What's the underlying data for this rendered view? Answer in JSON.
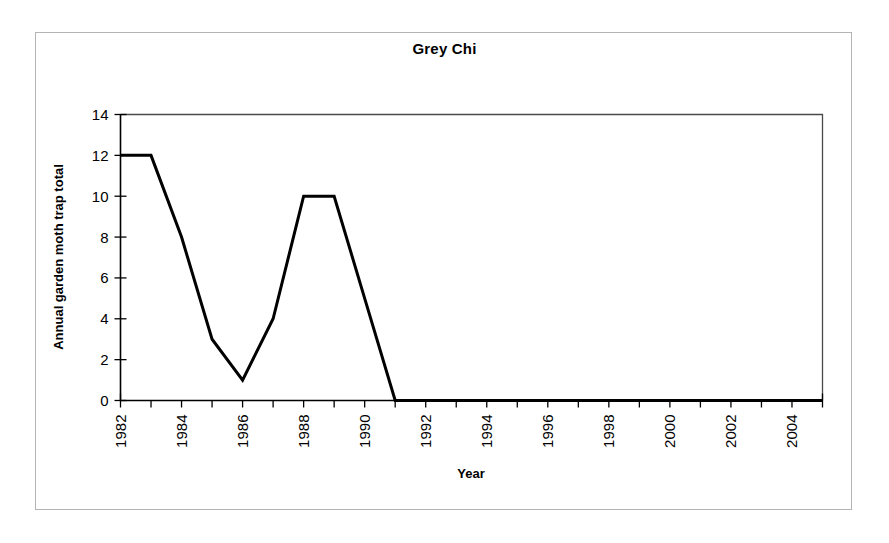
{
  "chart_data": {
    "type": "line",
    "title": "Grey Chi",
    "xlabel": "Year",
    "ylabel": "Annual garden moth trap total",
    "x": [
      1982,
      1983,
      1984,
      1985,
      1986,
      1987,
      1988,
      1989,
      1990,
      1991,
      1992,
      1993,
      1994,
      1995,
      1996,
      1997,
      1998,
      1999,
      2000,
      2001,
      2002,
      2003,
      2004,
      2005
    ],
    "values": [
      12,
      12,
      8,
      3,
      1,
      4,
      10,
      10,
      5,
      0,
      0,
      0,
      0,
      0,
      0,
      0,
      0,
      0,
      0,
      0,
      0,
      0,
      0,
      0
    ],
    "series": [
      {
        "name": "Grey Chi",
        "values": [
          12,
          12,
          8,
          3,
          1,
          4,
          10,
          10,
          5,
          0,
          0,
          0,
          0,
          0,
          0,
          0,
          0,
          0,
          0,
          0,
          0,
          0,
          0,
          0
        ],
        "color": "#000000"
      }
    ],
    "xlim": [
      1982,
      2005
    ],
    "ylim": [
      0,
      14
    ],
    "ytick_values": [
      0,
      2,
      4,
      6,
      8,
      10,
      12,
      14
    ],
    "ytick_labels": [
      "0",
      "2",
      "4",
      "6",
      "8",
      "10",
      "12",
      "14"
    ],
    "xtick_values": [
      1982,
      1983,
      1984,
      1985,
      1986,
      1987,
      1988,
      1989,
      1990,
      1991,
      1992,
      1993,
      1994,
      1995,
      1996,
      1997,
      1998,
      1999,
      2000,
      2001,
      2002,
      2003,
      2004,
      2005
    ],
    "xtick_labels_shown": [
      "1982",
      "1984",
      "1986",
      "1988",
      "1990",
      "1992",
      "1994",
      "1996",
      "1998",
      "2000",
      "2002",
      "2004"
    ],
    "xtick_labels_shown_values": [
      1982,
      1984,
      1986,
      1988,
      1990,
      1992,
      1994,
      1996,
      1998,
      2000,
      2002,
      2004
    ],
    "xtick_label_rotation": -90,
    "grid": false,
    "legend": false,
    "legend_position": "none",
    "markers": false,
    "line_color": "#000000",
    "axis_color": "#000000",
    "frame_color": "#4a4a4a",
    "background_color": "#ffffff"
  },
  "figure": {
    "page_border_color": "#b4b4b4"
  }
}
